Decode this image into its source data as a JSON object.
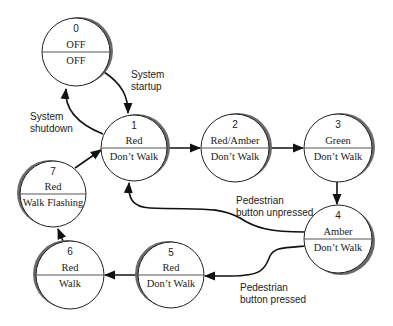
{
  "diagram": {
    "type": "state-machine",
    "colors": {
      "stroke": "#222222",
      "shadow": "#6a6a6a",
      "fill": "#ffffff",
      "divider": "#555555"
    },
    "states": [
      {
        "id": "0",
        "top": "OFF",
        "bottom": "OFF",
        "cx": 76,
        "cy": 52,
        "r": 34,
        "shadow": "right"
      },
      {
        "id": "1",
        "top": "Red",
        "bottom": "Don’t Walk",
        "cx": 134,
        "cy": 148,
        "r": 33,
        "shadow": "right"
      },
      {
        "id": "2",
        "top": "Red/Amber",
        "bottom": "Don’t Walk",
        "cx": 235,
        "cy": 148,
        "r": 34,
        "shadow": "right"
      },
      {
        "id": "3",
        "top": "Green",
        "bottom": "Don’t Walk",
        "cx": 338,
        "cy": 148,
        "r": 34,
        "shadow": "right"
      },
      {
        "id": "4",
        "top": "Amber",
        "bottom": "Don’t Walk",
        "cx": 338,
        "cy": 239,
        "r": 34,
        "shadow": "right-bottom"
      },
      {
        "id": "5",
        "top": "Red",
        "bottom": "Don’t Walk",
        "cx": 171,
        "cy": 275,
        "r": 33,
        "shadow": "left"
      },
      {
        "id": "6",
        "top": "Red",
        "bottom": "Walk",
        "cx": 70,
        "cy": 275,
        "r": 34,
        "shadow": "left"
      },
      {
        "id": "7",
        "top": "Red",
        "bottom": "Walk Flashing",
        "cx": 53,
        "cy": 194,
        "r": 33,
        "shadow": "left"
      }
    ],
    "transitions": [
      {
        "from": "0",
        "to": "1",
        "label": [
          "System",
          "startup"
        ]
      },
      {
        "from": "1",
        "to": "0",
        "label": [
          "System",
          "shutdown"
        ]
      },
      {
        "from": "1",
        "to": "2",
        "label": []
      },
      {
        "from": "2",
        "to": "3",
        "label": []
      },
      {
        "from": "3",
        "to": "4",
        "label": []
      },
      {
        "from": "4",
        "to": "1",
        "label": [
          "Pedestrian",
          "button unpressed"
        ]
      },
      {
        "from": "4",
        "to": "5",
        "label": [
          "Pedestrian",
          "button pressed"
        ]
      },
      {
        "from": "5",
        "to": "6",
        "label": []
      },
      {
        "from": "6",
        "to": "7",
        "label": []
      },
      {
        "from": "7",
        "to": "1",
        "label": []
      }
    ]
  }
}
